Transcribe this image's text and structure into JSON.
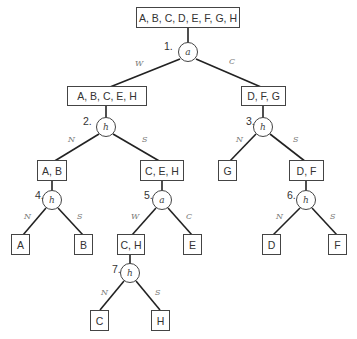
{
  "diagram": {
    "type": "decision-tree",
    "boxes": {
      "root": "A, B, C, D, E, F, G, H",
      "abceh": "A, B, C, E, H",
      "dfg": "D, F, G",
      "ab": "A, B",
      "ceh": "C, E, H",
      "g": "G",
      "df": "D, F",
      "a": "A",
      "b": "B",
      "ch": "C, H",
      "e": "E",
      "d": "D",
      "f": "F",
      "c": "C",
      "h": "H"
    },
    "nodes": [
      {
        "number": "1.",
        "symbol": "a"
      },
      {
        "number": "2.",
        "symbol": "h"
      },
      {
        "number": "3.",
        "symbol": "h"
      },
      {
        "number": "4.",
        "symbol": "h"
      },
      {
        "number": "5.",
        "symbol": "a"
      },
      {
        "number": "6.",
        "symbol": "h"
      },
      {
        "number": "7.",
        "symbol": "h"
      }
    ],
    "edge_labels": {
      "n1_left": "W",
      "n1_right": "C",
      "n2_left": "N",
      "n2_right": "S",
      "n3_left": "N",
      "n3_right": "S",
      "n4_left": "N",
      "n4_right": "S",
      "n5_left": "W",
      "n5_right": "C",
      "n6_left": "N",
      "n6_right": "S",
      "n7_left": "N",
      "n7_right": "S"
    }
  }
}
